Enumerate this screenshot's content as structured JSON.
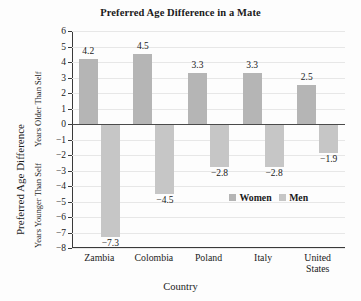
{
  "chart_data": {
    "type": "bar",
    "title": "Preferred Age Difference in a Mate",
    "xlabel": "Country",
    "ylabel": "Preferred Age Difference",
    "ylabel_upper": "Years Older Than Self",
    "ylabel_lower": "Years Younger Than Self",
    "categories": [
      "Zambia",
      "Colombia",
      "Poland",
      "Italy",
      "United States"
    ],
    "series": [
      {
        "name": "Women",
        "values": [
          4.2,
          4.5,
          3.3,
          3.3,
          2.5
        ],
        "color": "#b5b5b5"
      },
      {
        "name": "Men",
        "values": [
          -7.3,
          -4.5,
          -2.8,
          -2.8,
          -1.9
        ],
        "color": "#c6c6c6"
      }
    ],
    "ylim": [
      -8,
      6
    ],
    "yticks": [
      6,
      5,
      4,
      3,
      2,
      1,
      0,
      -1,
      -2,
      -3,
      -4,
      -5,
      -6,
      -7,
      -8
    ],
    "ytick_labels": [
      "6",
      "5",
      "4",
      "3",
      "2",
      "1",
      "0",
      "−1",
      "−2",
      "−3",
      "−4",
      "−5",
      "−6",
      "−7",
      "−8"
    ],
    "data_labels": {
      "women": [
        "4.2",
        "4.5",
        "3.3",
        "3.3",
        "2.5"
      ],
      "men": [
        "−7.3",
        "−4.5",
        "−2.8",
        "−2.8",
        "−1.9"
      ]
    },
    "grid": true,
    "legend_position": "inside-lower-right",
    "legend": [
      "Women",
      "Men"
    ],
    "category_label_lines": [
      [
        "Zambia"
      ],
      [
        "Colombia"
      ],
      [
        "Poland"
      ],
      [
        "Italy"
      ],
      [
        "United",
        "States"
      ]
    ]
  }
}
